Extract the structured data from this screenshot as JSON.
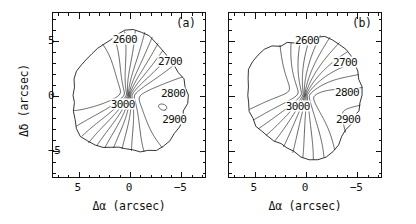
{
  "figure": {
    "width": 416,
    "height": 224,
    "background": "#ffffff",
    "ink": "#111111"
  },
  "axes": {
    "xlabel": "Δα  (arcsec)",
    "ylabel": "Δδ  (arcsec)",
    "x_ticklabels": [
      "5",
      "0",
      "−5"
    ],
    "y_ticklabels": [
      "5",
      "0",
      "−5"
    ],
    "x_tickvalues": [
      5,
      0,
      -5
    ],
    "y_tickvalues": [
      5,
      0,
      -5
    ],
    "xlim": [
      7.5,
      -7.5
    ],
    "ylim": [
      -7.5,
      7.5
    ],
    "x_inverted": true,
    "minor_ticks_per_major": 5
  },
  "panels": [
    {
      "id": "a",
      "label": "(a)",
      "contour_labels": [
        "2600",
        "2700",
        "2800",
        "2900",
        "3000"
      ]
    },
    {
      "id": "b",
      "label": "(b)",
      "contour_labels": [
        "2600",
        "2700",
        "2800",
        "2900",
        "3000"
      ]
    }
  ],
  "chart_data": {
    "type": "contour",
    "title": "",
    "xlabel": "Δα  (arcsec)",
    "ylabel": "Δδ  (arcsec)",
    "xlim": [
      7.5,
      -7.5
    ],
    "ylim": [
      -7.5,
      7.5
    ],
    "grid": false,
    "legend": "none",
    "units": "km s^-1",
    "contour_levels": [
      2550,
      2600,
      2650,
      2700,
      2750,
      2800,
      2850,
      2900,
      2950,
      3000,
      3050,
      3100
    ],
    "labeled_levels": [
      2600,
      2700,
      2800,
      2900,
      3000
    ],
    "panels": [
      {
        "id": "a",
        "panel_label": "(a)",
        "description": "Isovelocity (velocity field) contour map; spider-diagram rotation pattern with steep velocity gradient across the nucleus",
        "labeled_contours": [
          {
            "level": 2600,
            "x": 0.4,
            "y": 5.1
          },
          {
            "level": 2700,
            "x": -4.0,
            "y": 3.1
          },
          {
            "level": 2800,
            "x": -4.3,
            "y": 0.2
          },
          {
            "level": 2900,
            "x": -4.4,
            "y": -2.2
          },
          {
            "level": 3000,
            "x": 0.6,
            "y": -0.8
          }
        ]
      },
      {
        "id": "b",
        "panel_label": "(b)",
        "description": "Isovelocity (velocity field) contour map of model/second tracer; similar spider pattern with nuclear marker",
        "labeled_contours": [
          {
            "level": 2600,
            "x": -0.2,
            "y": 5.0
          },
          {
            "level": 2700,
            "x": -3.9,
            "y": 3.0
          },
          {
            "level": 2800,
            "x": -4.1,
            "y": 0.3
          },
          {
            "level": 2900,
            "x": -4.2,
            "y": -2.2
          },
          {
            "level": 3000,
            "x": 0.7,
            "y": -1.0
          }
        ],
        "markers": [
          {
            "name": "nucleus",
            "x": 0.8,
            "y": 4.6
          }
        ]
      }
    ]
  }
}
